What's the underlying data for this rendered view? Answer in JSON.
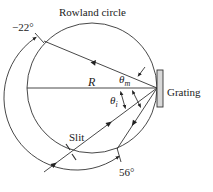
{
  "diagram": {
    "title": "Rowland circle",
    "labels": {
      "rowland_circle": "Rowland circle",
      "angle_start": "−22°",
      "angle_end": "56°",
      "radius": "R",
      "theta_m": "θ",
      "theta_m_sub": "m",
      "theta_i": "θ",
      "theta_i_sub": "i",
      "grating": "Grating",
      "slit": "Slit"
    },
    "colors": {
      "line": "#333333",
      "grating_fill": "#d9d9d9"
    }
  }
}
